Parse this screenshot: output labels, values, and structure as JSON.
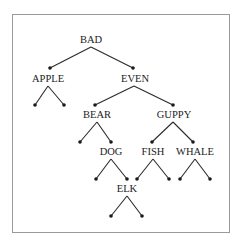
{
  "diagram": {
    "type": "binary-search-tree",
    "nodes": [
      {
        "id": "bad",
        "label": "BAD",
        "x": 91,
        "y": 40
      },
      {
        "id": "apple",
        "label": "APPLE",
        "x": 48,
        "y": 79
      },
      {
        "id": "even",
        "label": "EVEN",
        "x": 135,
        "y": 79
      },
      {
        "id": "bear",
        "label": "BEAR",
        "x": 97,
        "y": 115
      },
      {
        "id": "guppy",
        "label": "GUPPY",
        "x": 174,
        "y": 115
      },
      {
        "id": "dog",
        "label": "DOG",
        "x": 111,
        "y": 152
      },
      {
        "id": "fish",
        "label": "FISH",
        "x": 153,
        "y": 152
      },
      {
        "id": "whale",
        "label": "WHALE",
        "x": 195,
        "y": 152
      },
      {
        "id": "elk",
        "label": "ELK",
        "x": 127,
        "y": 189
      }
    ],
    "edges": [
      {
        "from": "bad",
        "to": "apple"
      },
      {
        "from": "bad",
        "to": "even"
      },
      {
        "from": "even",
        "to": "bear"
      },
      {
        "from": "even",
        "to": "guppy"
      },
      {
        "from": "bear",
        "to": "dog"
      },
      {
        "from": "guppy",
        "to": "fish"
      },
      {
        "from": "guppy",
        "to": "whale"
      },
      {
        "from": "dog",
        "to": "elk"
      }
    ],
    "empty_leaves": [
      "apple.left",
      "apple.right",
      "bear.left",
      "dog.left",
      "elk.left",
      "elk.right",
      "fish.left",
      "fish.right",
      "whale.left",
      "whale.right"
    ]
  }
}
